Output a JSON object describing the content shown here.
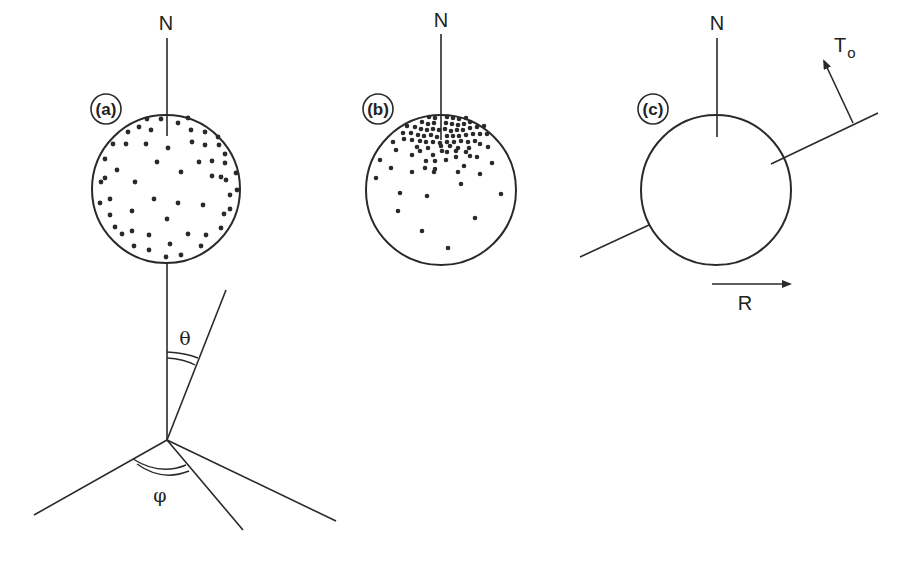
{
  "panels": {
    "a": {
      "label": "(a)",
      "north_label": "N",
      "theta_label": "θ",
      "phi_label": "φ",
      "description": "uniform random distribution of dots on sphere"
    },
    "b": {
      "label": "(b)",
      "north_label": "N",
      "description": "dots concentrated near north pole"
    },
    "c": {
      "label": "(c)",
      "north_label": "N",
      "torque_label": "T",
      "torque_subscript": "o",
      "rotation_label": "R",
      "description": "empty sphere with tilted axis, torque arrow and rotation arrow"
    }
  },
  "colors": {
    "stroke": "#2a2a2a",
    "background": "#ffffff"
  }
}
